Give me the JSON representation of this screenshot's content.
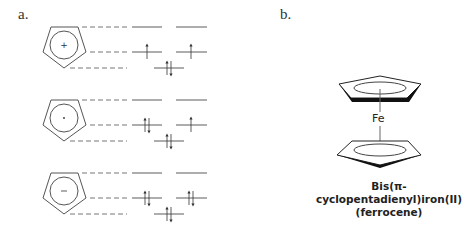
{
  "panel_a": {
    "label": "a.",
    "rings": [
      {
        "charge_symbol": "+",
        "name": "cyclopentadienyl-cation",
        "levels": {
          "top": [
            "empty",
            "empty"
          ],
          "middle": [
            "up",
            "up"
          ],
          "bottom": [
            "updown"
          ]
        }
      },
      {
        "charge_symbol": "·",
        "name": "cyclopentadienyl-radical",
        "levels": {
          "top": [
            "empty",
            "empty"
          ],
          "middle": [
            "updown",
            "up"
          ],
          "bottom": [
            "updown"
          ]
        }
      },
      {
        "charge_symbol": "−",
        "name": "cyclopentadienyl-anion",
        "levels": {
          "top": [
            "empty",
            "empty"
          ],
          "middle": [
            "updown",
            "updown"
          ],
          "bottom": [
            "updown"
          ]
        }
      }
    ]
  },
  "panel_b": {
    "label": "b.",
    "metal": "Fe",
    "caption_line1": "Bis(π-cyclopentadienyl)iron(II)",
    "caption_line2": "(ferrocene)"
  },
  "colors": {
    "line": "#555555",
    "level": "#8a8a8a",
    "dark": "#111111"
  }
}
